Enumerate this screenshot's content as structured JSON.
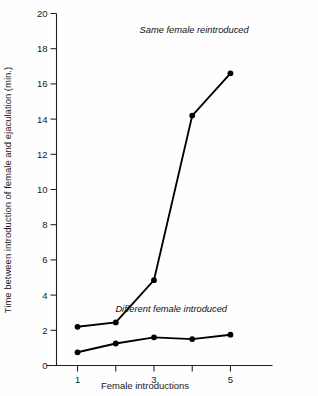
{
  "chart_data": {
    "type": "line",
    "title": "",
    "xlabel": "Female introductions",
    "ylabel": "Time between introduction of female and ejaculation (min.)",
    "x": [
      1,
      2,
      3,
      4,
      5
    ],
    "categories": [
      "1",
      "2",
      "3",
      "4",
      "5"
    ],
    "xlim": [
      0.45,
      6.1
    ],
    "ylim": [
      0,
      20
    ],
    "grid": false,
    "legend_position": "inline-annotations",
    "x_tick_values": [
      1,
      2,
      3,
      4,
      5
    ],
    "x_tick_labels": [
      "1",
      "",
      "3",
      "",
      "5"
    ],
    "y_tick_values": [
      0,
      2,
      4,
      6,
      8,
      10,
      12,
      14,
      16,
      18,
      20
    ],
    "y_tick_labels": [
      "0",
      "2",
      "4",
      "6",
      "8",
      "10",
      "12",
      "14",
      "16",
      "18",
      "20"
    ],
    "series": [
      {
        "name": "Same female reintroduced",
        "values": [
          2.2,
          2.45,
          4.85,
          14.2,
          16.6
        ],
        "marker": "filled-circle",
        "color": "#000000",
        "annotation": "Same female reintroduced"
      },
      {
        "name": "Different female introduced",
        "values": [
          0.75,
          1.25,
          1.6,
          1.5,
          1.75
        ],
        "marker": "filled-circle",
        "color": "#000000",
        "annotation": "Different female introduced"
      }
    ],
    "annotations": [
      {
        "text": "Same female reintroduced",
        "x": 4.05,
        "y": 18.9
      },
      {
        "text": "Different female introduced",
        "x": 3.45,
        "y": 3.05
      }
    ]
  },
  "axes": {
    "y_labels": [
      "20",
      "18",
      "16",
      "14",
      "12",
      "10",
      "8",
      "6",
      "4",
      "2",
      "0"
    ],
    "x_labels": [
      "1",
      "3",
      "5"
    ],
    "y_axis_title": "Time between introduction of female and ejaculation (min.)",
    "x_axis_title": "Female introductions"
  },
  "annotations": {
    "upper_series": "Same female reintroduced",
    "lower_series": "Different female introduced"
  },
  "style": {
    "background": "#fefefe",
    "axis_color": "#1f1f1f",
    "line_color": "#000000",
    "text_color": "#1a1a1a"
  }
}
